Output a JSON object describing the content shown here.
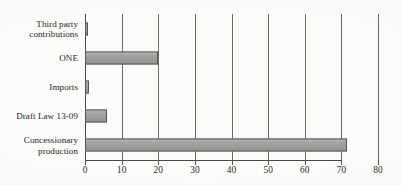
{
  "chart_data": {
    "type": "bar",
    "orientation": "horizontal",
    "title": "",
    "subtitle": "",
    "xlabel": "",
    "ylabel": "",
    "categories": [
      "Third party\ncontributions",
      "ONE",
      "Imports",
      "Draft Law 13-09",
      "Concessionary\nproduction"
    ],
    "values": [
      0.8,
      20,
      1,
      6,
      71.5
    ],
    "series": [
      {
        "name": "",
        "values": [
          0.8,
          20,
          1,
          6,
          71.5
        ]
      }
    ],
    "xlim": [
      0,
      80
    ],
    "xticks": [
      0,
      10,
      20,
      30,
      40,
      50,
      60,
      70,
      80
    ],
    "xtick_labels": [
      "0",
      "10",
      "20",
      "30",
      "40",
      "50",
      "60",
      "70",
      "80"
    ],
    "grid": "vertical",
    "legend": "none",
    "annotations": [],
    "colors": {
      "bar_fill": "#9b9b99",
      "bar_edge": "#57534f",
      "gridline": "#6e6b67",
      "axis": "#4a4744",
      "text": "#241f1d",
      "background": "#fbfbf9"
    }
  }
}
